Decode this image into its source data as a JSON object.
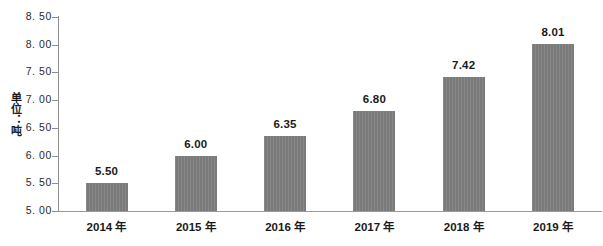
{
  "chart_data": {
    "type": "bar",
    "title": "",
    "xlabel": "",
    "ylabel": "单位：吨",
    "categories": [
      "2014 年",
      "2015 年",
      "2016 年",
      "2017 年",
      "2018 年",
      "2019 年"
    ],
    "values": [
      5.5,
      6.0,
      6.35,
      6.8,
      7.42,
      8.01
    ],
    "data_labels": [
      "5.50",
      "6.00",
      "6.35",
      "6.80",
      "7.42",
      "8.01"
    ],
    "ylim": [
      5.0,
      8.5
    ],
    "ytick_values": [
      5.0,
      5.5,
      6.0,
      6.5,
      7.0,
      7.5,
      8.0,
      8.5
    ],
    "ytick_labels": [
      "5. 00",
      "5. 50",
      "6. 00",
      "6. 50",
      "7. 00",
      "7. 50",
      "8. 00",
      "8. 50"
    ],
    "grid": false,
    "legend": false,
    "legend_position": "none",
    "series": [
      {
        "name": "",
        "values": [
          5.5,
          6.0,
          6.35,
          6.8,
          7.42,
          8.01
        ]
      }
    ]
  },
  "colors": {
    "bar_fill": "#7a7a7a",
    "axis_line": "#8e8e8e",
    "text": "#1a1a1a",
    "background": "#ffffff"
  }
}
